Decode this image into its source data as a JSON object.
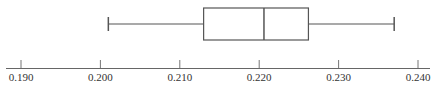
{
  "chart_data": {
    "type": "boxplot",
    "title": "",
    "xlabel": "",
    "ylabel": "",
    "orientation": "horizontal",
    "xlim": [
      0.1875,
      0.2415
    ],
    "grid": false,
    "ticks": [
      0.19,
      0.2,
      0.21,
      0.22,
      0.23,
      0.24
    ],
    "tick_labels": [
      "0.190",
      "0.200",
      "0.210",
      "0.220",
      "0.230",
      "0.240"
    ],
    "box": {
      "min": 0.201,
      "q1": 0.213,
      "median": 0.2206,
      "q3": 0.2262,
      "max": 0.237
    }
  },
  "colors": {
    "line": "#555555",
    "text": "#333333"
  }
}
